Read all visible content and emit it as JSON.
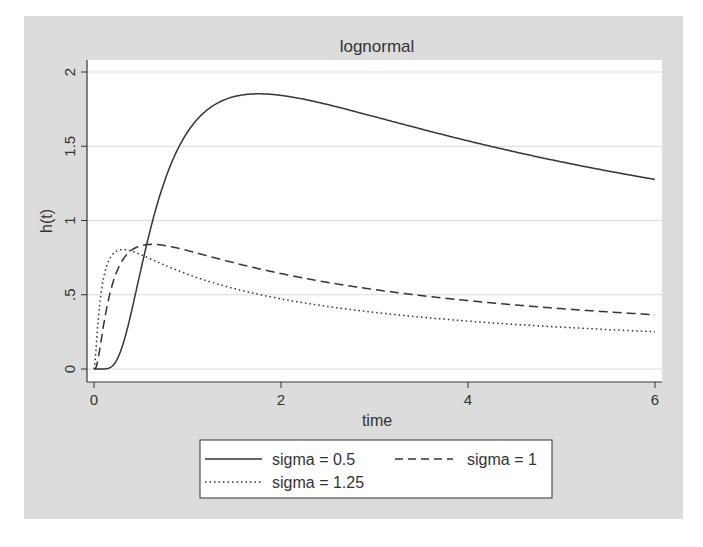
{
  "chart_data": {
    "type": "line",
    "title": "lognormal",
    "xlabel": "time",
    "ylabel": "h(t)",
    "xlim": [
      0,
      6
    ],
    "ylim": [
      0,
      2
    ],
    "x_ticks": [
      0,
      2,
      4,
      6
    ],
    "x_tick_labels": [
      "0",
      "2",
      "4",
      "6"
    ],
    "y_ticks": [
      0,
      0.5,
      1,
      1.5,
      2
    ],
    "y_tick_labels": [
      "0",
      ".5",
      "1",
      "1.5",
      "2"
    ],
    "grid": true,
    "legend_position": "bottom",
    "series": [
      {
        "name": "sigma = 0.5",
        "style": "solid",
        "sigma": 0.5,
        "x": [
          0,
          0.25,
          0.5,
          0.75,
          1,
          1.25,
          1.5,
          1.75,
          2,
          2.5,
          3,
          3.5,
          4,
          4.5,
          5,
          5.5,
          6
        ],
        "y": [
          0,
          0.04,
          0.53,
          1.2,
          1.6,
          1.77,
          1.83,
          1.84,
          1.82,
          1.74,
          1.64,
          1.55,
          1.47,
          1.4,
          1.33,
          1.27,
          1.22
        ]
      },
      {
        "name": "sigma = 1",
        "style": "dashed",
        "sigma": 1,
        "x": [
          0,
          0.1,
          0.25,
          0.5,
          0.65,
          1,
          1.5,
          2,
          2.5,
          3,
          3.5,
          4,
          4.5,
          5,
          5.5,
          6
        ],
        "y": [
          0,
          0.24,
          0.66,
          0.82,
          0.83,
          0.8,
          0.72,
          0.65,
          0.58,
          0.52,
          0.47,
          0.43,
          0.4,
          0.37,
          0.34,
          0.32
        ]
      },
      {
        "name": "sigma = 1.25",
        "style": "dotted",
        "sigma": 1.25,
        "x": [
          0,
          0.05,
          0.1,
          0.2,
          0.3,
          0.5,
          0.75,
          1,
          1.5,
          2,
          2.5,
          3,
          3.5,
          4,
          4.5,
          5,
          5.5,
          6
        ],
        "y": [
          0,
          0.36,
          0.6,
          0.78,
          0.8,
          0.75,
          0.67,
          0.6,
          0.51,
          0.44,
          0.39,
          0.35,
          0.31,
          0.29,
          0.26,
          0.24,
          0.23,
          0.21
        ]
      }
    ]
  },
  "legend": {
    "items": [
      {
        "label": "sigma = 0.5",
        "style": "solid"
      },
      {
        "label": "sigma = 1",
        "style": "dashed"
      },
      {
        "label": "sigma = 1.25",
        "style": "dotted"
      }
    ]
  },
  "colors": {
    "frame": "#dcdcdc",
    "plot_bg": "#ffffff",
    "line": "#333333",
    "grid": "#d9d9d9"
  }
}
